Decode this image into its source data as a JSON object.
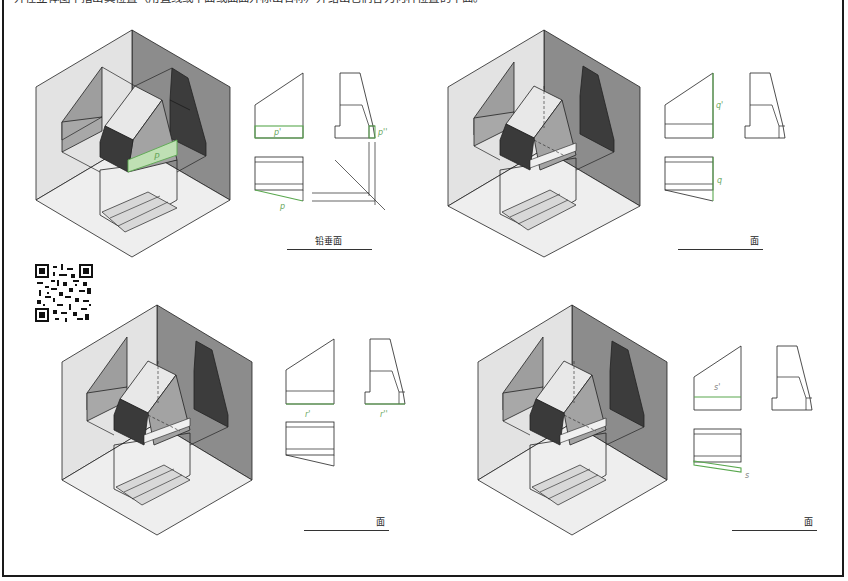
{
  "page": {
    "instruction": "并在立体图中指出其位置（用直线或平面或曲面并标出名称）并给出它们各为何种位置的平面。",
    "colors": {
      "highlight_green": "#5aa84f",
      "highlight_fill": "#bfe0b4",
      "plane_light": "#e6e6e6",
      "plane_mid": "#bdbdbd",
      "plane_dark": "#8c8c8c",
      "solid_dark": "#3a3a3a",
      "line": "#222222"
    }
  },
  "panels": [
    {
      "id": "p",
      "labels": {
        "front": "p'",
        "side": "p''",
        "top": "p",
        "iso": "P"
      },
      "answer_text": "铅垂面",
      "answer_filled": true
    },
    {
      "id": "q",
      "labels": {
        "front": "q'",
        "top": "q"
      },
      "answer_text": "面",
      "answer_filled": false
    },
    {
      "id": "r",
      "labels": {
        "front": "r'",
        "side": "r''"
      },
      "answer_text": "面",
      "answer_filled": false
    },
    {
      "id": "s",
      "labels": {
        "front": "s'",
        "top": "s"
      },
      "answer_text": "面",
      "answer_filled": false
    }
  ],
  "qr_code": {
    "label": "qr-code"
  }
}
